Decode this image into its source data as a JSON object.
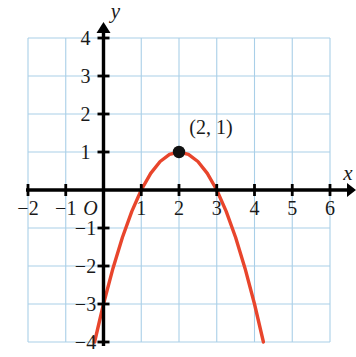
{
  "figure": {
    "name": "coordinate-plane-parabola",
    "background_color": "#ffffff",
    "grid_color": "#a9cfe8",
    "axis_color": "#000000",
    "curve_color": "#e8452c",
    "point_color": "#111111",
    "text_color": "#1a1a1a"
  },
  "axes": {
    "x_label": "x",
    "y_label": "y",
    "origin_label": "O",
    "x_ticks": [
      {
        "value": -2,
        "label": "−2"
      },
      {
        "value": -1,
        "label": "−1"
      },
      {
        "value": 1,
        "label": "1"
      },
      {
        "value": 2,
        "label": "2"
      },
      {
        "value": 3,
        "label": "3"
      },
      {
        "value": 4,
        "label": "4"
      },
      {
        "value": 5,
        "label": "5"
      },
      {
        "value": 6,
        "label": "6"
      }
    ],
    "y_ticks": [
      {
        "value": 4,
        "label": "4"
      },
      {
        "value": 3,
        "label": "3"
      },
      {
        "value": 2,
        "label": "2"
      },
      {
        "value": 1,
        "label": "1"
      },
      {
        "value": -1,
        "label": "−1"
      },
      {
        "value": -2,
        "label": "−2"
      },
      {
        "value": -3,
        "label": "−3"
      },
      {
        "value": -4,
        "label": "−4"
      }
    ]
  },
  "annotations": [
    {
      "name": "vertex-label",
      "text": "(2, 1)",
      "x": 2,
      "y": 1
    }
  ],
  "chart_data": {
    "type": "line",
    "title": "",
    "subtitle": "",
    "xlabel": "x",
    "ylabel": "y",
    "xlim": [
      -2,
      6
    ],
    "ylim": [
      -4,
      4
    ],
    "xticks": [
      -2,
      -1,
      0,
      1,
      2,
      3,
      4,
      5,
      6
    ],
    "yticks": [
      -4,
      -3,
      -2,
      -1,
      0,
      1,
      2,
      3,
      4
    ],
    "grid": true,
    "grid_spacing": 1,
    "legend": null,
    "legend_position": "none",
    "series": [
      {
        "name": "parabola",
        "kind": "curve",
        "equation": "y = -(x - 2)^2 + 1",
        "vertex": [
          2,
          1
        ],
        "opens": "down",
        "x_intercepts": [
          1,
          3
        ],
        "y_intercept": -3,
        "color": "#e8452c",
        "x_range": [
          -0.25,
          4.25
        ],
        "points": [
          [
            -0.236,
            -4.0
          ],
          [
            0.0,
            -3.0
          ],
          [
            0.25,
            -2.0625
          ],
          [
            0.5,
            -1.25
          ],
          [
            0.75,
            -0.5625
          ],
          [
            1.0,
            0.0
          ],
          [
            1.25,
            0.4375
          ],
          [
            1.5,
            0.75
          ],
          [
            1.75,
            0.9375
          ],
          [
            2.0,
            1.0
          ],
          [
            2.25,
            0.9375
          ],
          [
            2.5,
            0.75
          ],
          [
            2.75,
            0.4375
          ],
          [
            3.0,
            0.0
          ],
          [
            3.25,
            -0.5625
          ],
          [
            3.5,
            -1.25
          ],
          [
            3.75,
            -2.0625
          ],
          [
            4.0,
            -3.0
          ],
          [
            4.236,
            -4.0
          ]
        ]
      }
    ],
    "annotated_points": [
      {
        "x": 2,
        "y": 1,
        "label": "(2, 1)",
        "marker": "filled-circle"
      }
    ]
  }
}
